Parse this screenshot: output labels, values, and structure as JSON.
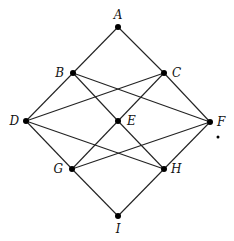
{
  "diagram": {
    "type": "lattice-graph",
    "nodes": [
      {
        "id": "A",
        "label": "A",
        "x": 118,
        "y": 27,
        "lx": 118,
        "ly": 19,
        "anchor": "middle"
      },
      {
        "id": "B",
        "label": "B",
        "x": 73,
        "y": 73,
        "lx": 64,
        "ly": 77,
        "anchor": "end"
      },
      {
        "id": "C",
        "label": "C",
        "x": 164,
        "y": 73,
        "lx": 172,
        "ly": 77,
        "anchor": "start"
      },
      {
        "id": "D",
        "label": "D",
        "x": 26,
        "y": 121,
        "lx": 19,
        "ly": 125,
        "anchor": "end"
      },
      {
        "id": "E",
        "label": "E",
        "x": 118,
        "y": 121,
        "lx": 127,
        "ly": 125,
        "anchor": "start"
      },
      {
        "id": "F",
        "label": "F",
        "x": 210,
        "y": 122,
        "lx": 217,
        "ly": 126,
        "anchor": "start"
      },
      {
        "id": "G",
        "label": "G",
        "x": 72,
        "y": 169,
        "lx": 63,
        "ly": 173,
        "anchor": "end"
      },
      {
        "id": "H",
        "label": "H",
        "x": 164,
        "y": 169,
        "lx": 171,
        "ly": 173,
        "anchor": "start"
      },
      {
        "id": "I",
        "label": "I",
        "x": 118,
        "y": 216,
        "lx": 118,
        "ly": 233,
        "anchor": "middle"
      }
    ],
    "edges": [
      [
        "A",
        "B"
      ],
      [
        "A",
        "C"
      ],
      [
        "B",
        "D"
      ],
      [
        "B",
        "E"
      ],
      [
        "B",
        "F"
      ],
      [
        "C",
        "D"
      ],
      [
        "C",
        "E"
      ],
      [
        "C",
        "F"
      ],
      [
        "D",
        "G"
      ],
      [
        "D",
        "H"
      ],
      [
        "E",
        "G"
      ],
      [
        "E",
        "H"
      ],
      [
        "F",
        "G"
      ],
      [
        "F",
        "H"
      ],
      [
        "G",
        "I"
      ],
      [
        "H",
        "I"
      ]
    ],
    "stray_marks": [
      {
        "x": 218,
        "y": 137,
        "r": 1.5
      }
    ],
    "colors": {
      "line": "#222222",
      "node": "#000000",
      "background": "#ffffff"
    }
  }
}
